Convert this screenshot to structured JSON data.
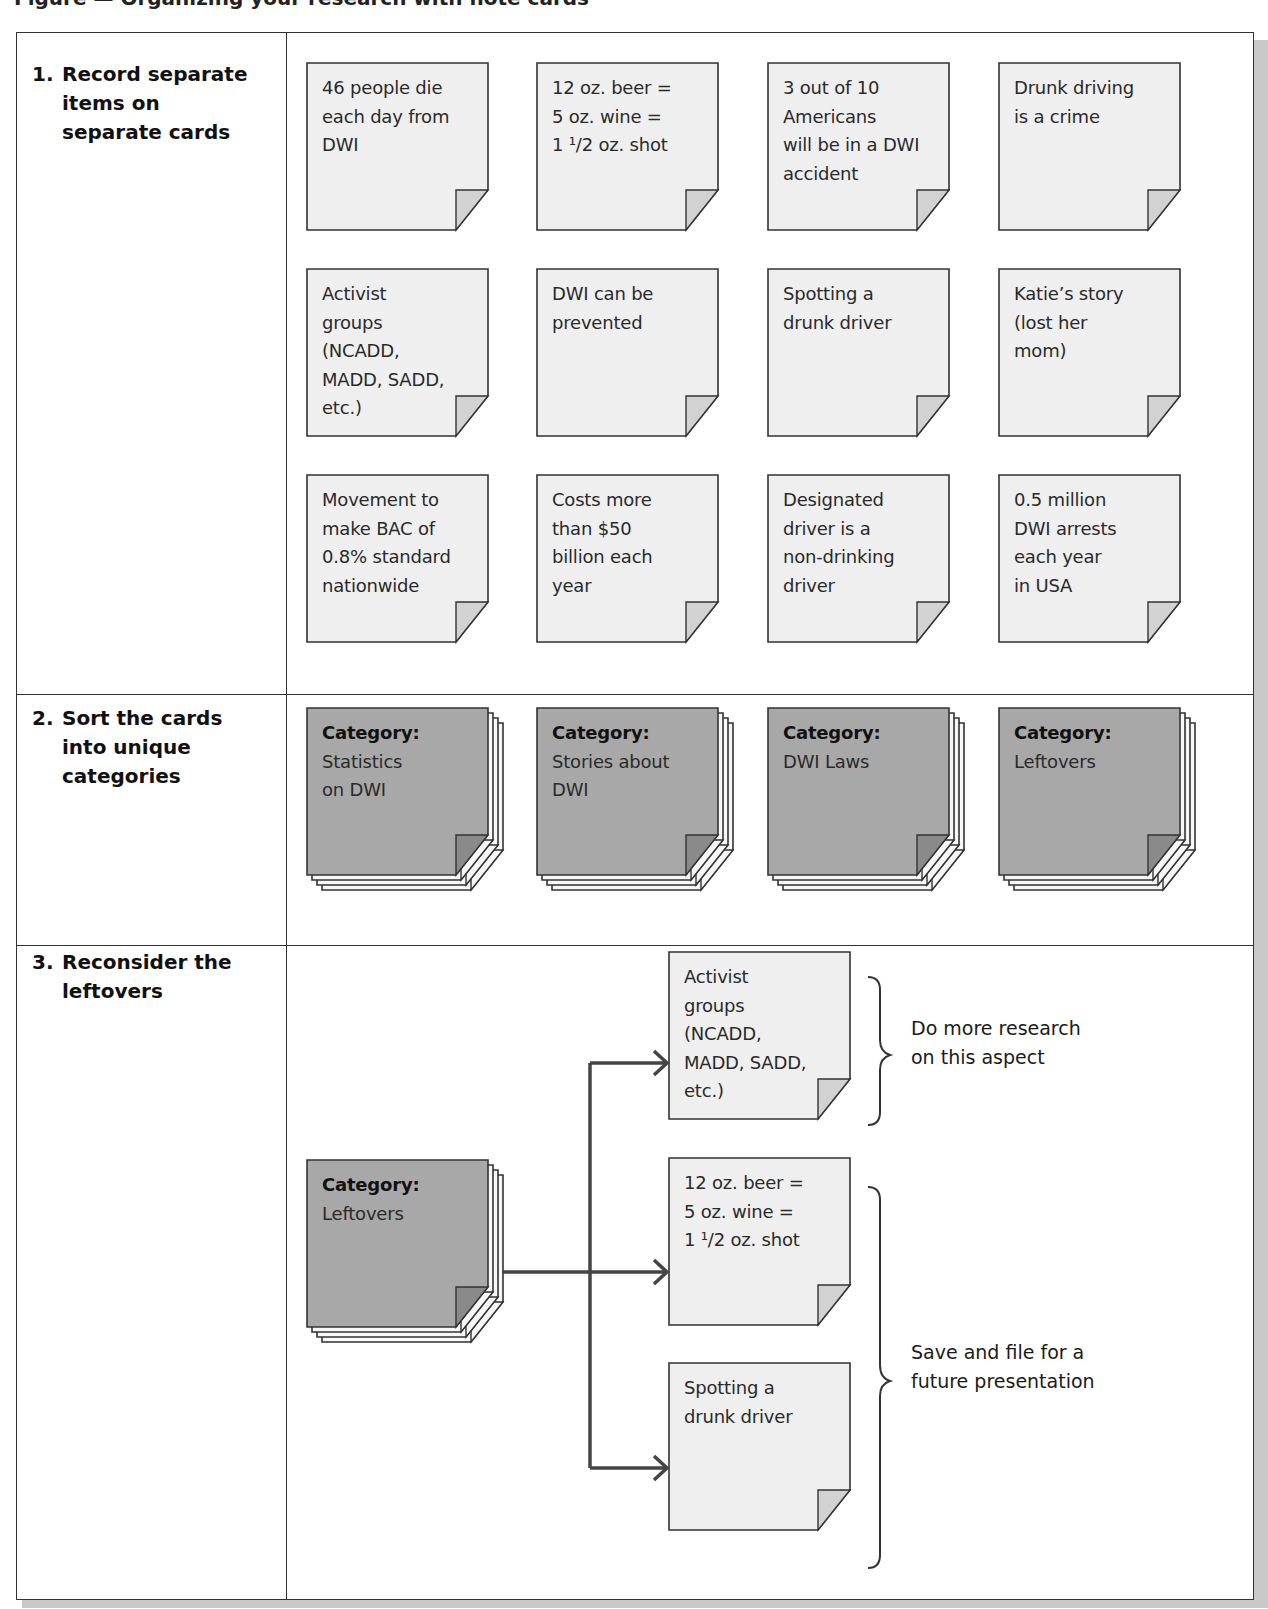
{
  "caption_clipped": "Figure — Organizing your research with note cards",
  "colors": {
    "border": "#333333",
    "card_light": "#efefef",
    "card_dark": "#a8a8a8",
    "fold_light": "#d2d2d2",
    "fold_dark": "#8a8a8a",
    "shadow": "#c9c9c9"
  },
  "steps": [
    {
      "number": "1.",
      "label": "Record separate items on separate cards"
    },
    {
      "number": "2.",
      "label": "Sort the cards into unique categories"
    },
    {
      "number": "3.",
      "label": "Reconsider the leftovers"
    }
  ],
  "step1_cards": [
    {
      "text": "46 people die each day from DWI"
    },
    {
      "text": "12 oz. beer = 5 oz. wine = 1 1/2 oz. shot"
    },
    {
      "text": "3 out of 10 Americans will be in a DWI accident"
    },
    {
      "text": "Drunk driving is a crime"
    },
    {
      "text": "Activist groups (NCADD, MADD, SADD, etc.)"
    },
    {
      "text": "DWI can be prevented"
    },
    {
      "text": "Spotting a drunk driver"
    },
    {
      "text": "Katie's story (lost her mom)"
    },
    {
      "text": "Movement to make BAC of 0.8% standard nationwide"
    },
    {
      "text": "Costs more than $50 billion each year"
    },
    {
      "text": "Designated driver is a non-drinking driver"
    },
    {
      "text": "0.5 million DWI arrests each year in USA"
    }
  ],
  "step1_lines": [
    [
      "46 people die",
      "each day from",
      "DWI"
    ],
    [
      "12 oz. beer =",
      "5 oz. wine =",
      "1 ¹/2 oz. shot"
    ],
    [
      "3 out of 10",
      "Americans",
      "will be in a DWI",
      "accident"
    ],
    [
      "Drunk driving",
      "is a crime"
    ],
    [
      "Activist",
      "groups",
      "(NCADD,",
      "MADD, SADD,",
      "etc.)"
    ],
    [
      "DWI can be",
      "prevented"
    ],
    [
      "Spotting a",
      "drunk driver"
    ],
    [
      "Katie’s story",
      "(lost her",
      "mom)"
    ],
    [
      "Movement to",
      "make BAC of",
      "0.8% standard",
      "nationwide"
    ],
    [
      "Costs more",
      "than $50",
      "billion each",
      "year"
    ],
    [
      "Designated",
      "driver is a",
      "non-drinking",
      "driver"
    ],
    [
      "0.5 million",
      "DWI arrests",
      "each year",
      "in USA"
    ]
  ],
  "step2_categories": [
    {
      "heading": "Category:",
      "lines": [
        "Statistics",
        "on DWI"
      ]
    },
    {
      "heading": "Category:",
      "lines": [
        "Stories about",
        "DWI"
      ]
    },
    {
      "heading": "Category:",
      "lines": [
        "DWI Laws"
      ]
    },
    {
      "heading": "Category:",
      "lines": [
        "Leftovers"
      ]
    }
  ],
  "step3": {
    "source": {
      "heading": "Category:",
      "lines": [
        "Leftovers"
      ]
    },
    "targets": [
      {
        "lines": [
          "Activist",
          "groups",
          "(NCADD,",
          "MADD, SADD,",
          "etc.)"
        ]
      },
      {
        "lines": [
          "12 oz. beer =",
          "5 oz. wine =",
          "1 ¹/2 oz. shot"
        ]
      },
      {
        "lines": [
          "Spotting a",
          "drunk driver"
        ]
      }
    ],
    "notes": [
      {
        "lines": [
          "Do more research",
          "on this aspect"
        ]
      },
      {
        "lines": [
          "Save and file for a",
          "future presentation"
        ]
      }
    ]
  }
}
